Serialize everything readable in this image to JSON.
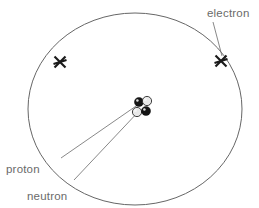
{
  "diagram": {
    "type": "atomic-model",
    "canvas": {
      "width": 259,
      "height": 208,
      "background": "#ffffff"
    },
    "labels": {
      "electron": "electron",
      "proton": "proton",
      "neutron": "neutron"
    },
    "colors": {
      "orbit_stroke": "#666666",
      "leader_stroke": "#7a7a7a",
      "text": "#6a6a6a",
      "proton_fill": "#141414",
      "neutron_fill": "#e8e8e8",
      "electron_marker": "#1a1a1a"
    },
    "orbit": {
      "center_x": 135,
      "center_y": 109,
      "radius_x": 107,
      "radius_y": 96
    },
    "electrons": [
      {
        "name": "electron-left",
        "x": 60,
        "y": 62,
        "marker": "x-cross"
      },
      {
        "name": "electron-right",
        "x": 221,
        "y": 61,
        "marker": "x-cross"
      }
    ],
    "nucleus": {
      "center_x": 142,
      "center_y": 108,
      "particles": [
        {
          "name": "proton-1",
          "kind": "proton",
          "x": 139,
          "y": 102,
          "r": 4.6
        },
        {
          "name": "neutron-1",
          "kind": "neutron",
          "x": 147,
          "y": 101,
          "r": 4.6
        },
        {
          "name": "neutron-2",
          "kind": "neutron",
          "x": 137,
          "y": 112,
          "r": 4.6
        },
        {
          "name": "proton-2",
          "kind": "proton",
          "x": 146,
          "y": 111,
          "r": 4.6
        }
      ]
    }
  }
}
